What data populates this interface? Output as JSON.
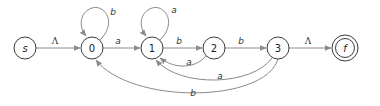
{
  "diagram": {
    "type": "finite-automaton",
    "nodes": [
      {
        "id": "s",
        "label": "s",
        "final": false
      },
      {
        "id": "0",
        "label": "0",
        "final": false
      },
      {
        "id": "1",
        "label": "1",
        "final": false
      },
      {
        "id": "2",
        "label": "2",
        "final": false
      },
      {
        "id": "3",
        "label": "3",
        "final": false
      },
      {
        "id": "f",
        "label": "f",
        "final": true
      }
    ],
    "edges": [
      {
        "from": "s",
        "to": "0",
        "label": "Λ"
      },
      {
        "from": "0",
        "to": "0",
        "label": "b"
      },
      {
        "from": "0",
        "to": "1",
        "label": "a"
      },
      {
        "from": "1",
        "to": "1",
        "label": "a"
      },
      {
        "from": "1",
        "to": "2",
        "label": "b"
      },
      {
        "from": "2",
        "to": "1",
        "label": "a"
      },
      {
        "from": "2",
        "to": "3",
        "label": "b"
      },
      {
        "from": "3",
        "to": "1",
        "label": "a"
      },
      {
        "from": "3",
        "to": "0",
        "label": "b"
      },
      {
        "from": "3",
        "to": "f",
        "label": "Λ"
      }
    ]
  },
  "colors": {
    "edge": "#8a8a8a",
    "node_stroke": "#3a3a3a",
    "text": "#222222"
  }
}
